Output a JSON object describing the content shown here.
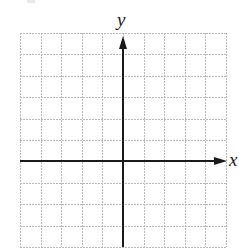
{
  "diagram": {
    "type": "cartesian-coordinate-grid",
    "grid": {
      "columns": 10,
      "rows": 10,
      "left": 20,
      "top": 33,
      "right": 226,
      "bottom": 247,
      "line_color": "#b8b8b8"
    },
    "axes": {
      "color": "#1a1a1a",
      "x_axis": {
        "label": "x",
        "row_position": 6
      },
      "y_axis": {
        "label": "y",
        "column_position": 5
      }
    }
  }
}
